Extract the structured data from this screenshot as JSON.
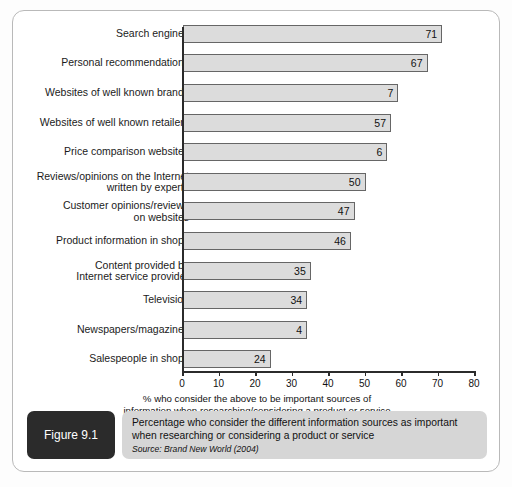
{
  "figure": {
    "number_label": "Figure 9.1",
    "caption_line1": "Percentage who consider the different information sources as important",
    "caption_line2": "when researching or considering a product or service",
    "source": "Source: Brand New World (2004)"
  },
  "axis": {
    "x_ticks": [
      "0",
      "10",
      "20",
      "30",
      "40",
      "50",
      "60",
      "70",
      "80"
    ],
    "x_caption_line1": "% who consider the above to be important sources of",
    "x_caption_line2": "information when researching/considering a product or service"
  },
  "chart_data": {
    "type": "bar",
    "orientation": "horizontal",
    "title": "Percentage who consider the different information sources as important when researching or considering a product or service",
    "xlabel": "% who consider the above to be important sources of information when researching/considering a product or service",
    "ylabel": "",
    "xlim": [
      0,
      80
    ],
    "grid": false,
    "legend": false,
    "source": "Brand New World (2004)",
    "categories": [
      "Search engines",
      "Personal recommendations",
      "Websites of well known brands",
      "Websites of well known retailers",
      "Price comparison websites",
      "Reviews/opinions on the Internet written by experts",
      "Customer opinions/reviews on websites",
      "Product information in shops",
      "Content provided by Internet service provider",
      "Television",
      "Newspapers/magazines",
      "Salespeople in shops"
    ],
    "values": [
      71,
      67,
      59,
      57,
      56,
      50,
      47,
      46,
      35,
      34,
      34,
      24
    ],
    "data_labels": [
      "71",
      "67",
      "7",
      "57",
      "6",
      "50",
      "47",
      "46",
      "35",
      "34",
      "4",
      "24"
    ]
  },
  "rows": [
    {
      "lines": [
        "Search engines"
      ],
      "value": 71,
      "label": "71",
      "faint": false
    },
    {
      "lines": [
        "Personal recommendations"
      ],
      "value": 67,
      "label": "67",
      "faint": false
    },
    {
      "lines": [
        "Websites of well known brands"
      ],
      "value": 59,
      "label": "7",
      "faint": false
    },
    {
      "lines": [
        "Websites of well known retailers"
      ],
      "value": 57,
      "label": "57",
      "faint": false
    },
    {
      "lines": [
        "Price comparison websites"
      ],
      "value": 56,
      "label": "6",
      "faint": false
    },
    {
      "lines": [
        "Reviews/opinions on the Internet",
        "written by experts"
      ],
      "value": 50,
      "label": "50",
      "faint": false
    },
    {
      "lines": [
        "Customer opinions/reviews",
        "on websites"
      ],
      "value": 47,
      "label": "47",
      "faint": false
    },
    {
      "lines": [
        "Product information in shops"
      ],
      "value": 46,
      "label": "46",
      "faint": false
    },
    {
      "lines": [
        "Content provided by",
        "Internet service provider"
      ],
      "value": 35,
      "label": "35",
      "faint": false
    },
    {
      "lines": [
        "Television"
      ],
      "value": 34,
      "label": "34",
      "faint": false
    },
    {
      "lines": [
        "Newspapers/magazines"
      ],
      "value": 34,
      "label": "4",
      "faint": false
    },
    {
      "lines": [
        "Salespeople in shops"
      ],
      "value": 24,
      "label": "24",
      "faint": false
    }
  ],
  "colors": {
    "bar_fill": "#dcdcdc",
    "bar_stroke": "#666666",
    "axis": "#2b2b2b",
    "caption_box": "#d6d6d6",
    "figure_tag": "#2b2b2b"
  }
}
